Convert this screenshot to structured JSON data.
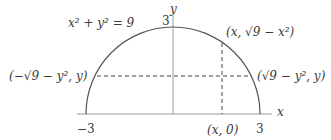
{
  "diagram": {
    "equation_label": "x² + y² = 9",
    "y_axis_label": "y",
    "x_axis_label": "x",
    "y_intercept_label": "3",
    "x_min_label": "−3",
    "x_max_label": "3",
    "point_top_label": "(x, √9 − x²)",
    "point_left_label": "(−√9 − y², y)",
    "point_right_label": "(√9 − y², y)",
    "point_axis_label": "(x, 0)",
    "colors": {
      "curve": "#555555",
      "axis": "#999999",
      "dashed": "#444444",
      "text": "#3a3a3a"
    },
    "geometry": {
      "center_x": 173,
      "center_y": 114,
      "radius": 87,
      "dashed_vertical_x": 222,
      "dashed_horizontal_y": 76
    }
  }
}
